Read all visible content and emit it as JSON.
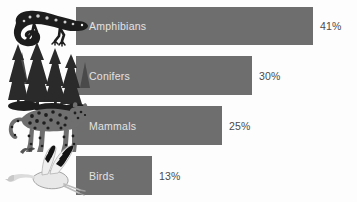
{
  "chart_data": {
    "type": "bar",
    "orientation": "horizontal",
    "title": "",
    "subtitle": "",
    "xlabel": "",
    "ylabel": "",
    "categories": [
      "Amphibians",
      "Conifers",
      "Mammals",
      "Birds"
    ],
    "values": [
      41,
      30,
      25,
      13
    ],
    "value_labels": [
      "41%",
      "30%",
      "25%",
      "13%"
    ],
    "unit": "%",
    "xlim": [
      0,
      41
    ],
    "grid": false,
    "legend": null,
    "annotations": [],
    "series": [
      {
        "name": "Percent threatened",
        "values": [
          41,
          30,
          25,
          13
        ]
      }
    ]
  },
  "style": {
    "bar_color": "#6e6e6e",
    "bar_label_color": "#e3e3e3",
    "value_label_color": "#4a4a4a",
    "background_color": "#fdfdfd"
  },
  "rows": [
    {
      "label": "Amphibians",
      "value_label": "41%",
      "value": 41,
      "icon": "salamander-illustration",
      "bar_width_px": 237,
      "value_x_px": 320
    },
    {
      "label": "Conifers",
      "value_label": "30%",
      "value": 30,
      "icon": "conifer-trees-illustration",
      "bar_width_px": 176,
      "value_x_px": 259
    },
    {
      "label": "Mammals",
      "value_label": "25%",
      "value": 25,
      "icon": "leopard-illustration",
      "bar_width_px": 146,
      "value_x_px": 229
    },
    {
      "label": "Birds",
      "value_label": "13%",
      "value": 13,
      "icon": "flying-crane-illustration",
      "bar_width_px": 76,
      "value_x_px": 159
    }
  ]
}
